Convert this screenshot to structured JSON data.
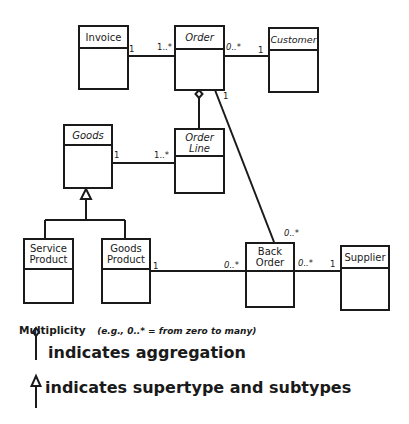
{
  "diagram": {
    "type": "UML class diagram",
    "classes": [
      {
        "id": "invoice",
        "name": "Invoice"
      },
      {
        "id": "order",
        "name": "Order"
      },
      {
        "id": "customer",
        "name": "Customer"
      },
      {
        "id": "goods",
        "name": "Goods"
      },
      {
        "id": "order_line",
        "name": "Order Line"
      },
      {
        "id": "service_product",
        "name": "Service Product"
      },
      {
        "id": "goods_product",
        "name": "Goods Product"
      },
      {
        "id": "back_order",
        "name": "Back Order"
      },
      {
        "id": "supplier",
        "name": "Supplier"
      }
    ],
    "associations": [
      {
        "from": "Invoice",
        "to": "Order",
        "from_mult": "1",
        "to_mult": "1..*"
      },
      {
        "from": "Order",
        "to": "Customer",
        "from_mult": "0..*",
        "to_mult": "1"
      },
      {
        "from": "Goods",
        "to": "Order Line",
        "from_mult": "1",
        "to_mult": "1..*"
      },
      {
        "from": "Order",
        "to": "Back Order",
        "from_mult": "1",
        "to_mult": "0..*"
      },
      {
        "from": "Goods Product",
        "to": "Back Order",
        "from_mult": "1",
        "to_mult": "0..*"
      },
      {
        "from": "Back Order",
        "to": "Supplier",
        "from_mult": "0..*",
        "to_mult": "1"
      }
    ],
    "aggregations": [
      {
        "whole": "Order",
        "part": "Order Line"
      }
    ],
    "generalizations": [
      {
        "supertype": "Goods",
        "subtypes": [
          "Service Product",
          "Goods Product"
        ]
      }
    ],
    "labels": {
      "invoice_order_a": "1",
      "invoice_order_b": "1..*",
      "order_customer_a": "0..*",
      "order_customer_b": "1",
      "goods_orderline_a": "1",
      "goods_orderline_b": "1..*",
      "order_backorder_a": "1",
      "order_backorder_b": "0..*",
      "goodsproduct_backorder_a": "1",
      "goodsproduct_backorder_b": "0..*",
      "backorder_supplier_a": "0..*",
      "backorder_supplier_b": "1"
    }
  },
  "legend": {
    "title": "Multiplicity",
    "example": "(e.g., 0..* = from zero to many)",
    "aggregation": "indicates aggregation",
    "generalization": "indicates supertype and subtypes"
  }
}
